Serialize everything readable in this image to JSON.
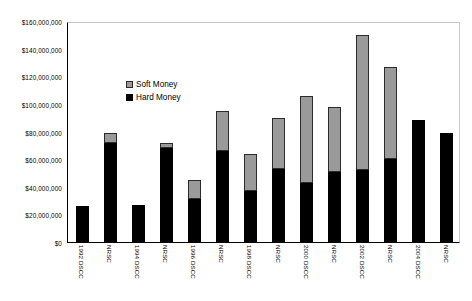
{
  "chart_data": {
    "type": "bar",
    "subtype": "stacked",
    "title": "",
    "xlabel": "",
    "ylabel": "",
    "ylim": [
      0,
      160000000
    ],
    "ytick_values": [
      0,
      20000000,
      40000000,
      60000000,
      80000000,
      100000000,
      120000000,
      140000000,
      160000000
    ],
    "ytick_labels": [
      "$0",
      "$20,000,000",
      "$40,000,000",
      "$60,000,000",
      "$80,000,000",
      "$100,000,000",
      "$120,000,000",
      "$140,000,000",
      "$160,000,000"
    ],
    "grid": false,
    "legend_position": "inside-upper-left",
    "categories": [
      "1992 DSCC",
      "NRSC",
      "1994 DSCC",
      "NRSC",
      "1996 DSCC",
      "NRSC",
      "1998 DSCC",
      "NRSC",
      "2000 DSCC",
      "NRSC",
      "2002 DSCC",
      "NRSC",
      "2004 DSCC",
      "NRSC"
    ],
    "series": [
      {
        "name": "Hard Money",
        "color": "#000000",
        "values": [
          26000000,
          72000000,
          27000000,
          68000000,
          31000000,
          66000000,
          37000000,
          53000000,
          43000000,
          51000000,
          52000000,
          60000000,
          88000000,
          79000000
        ]
      },
      {
        "name": "Soft Money",
        "color": "#9a9a9a",
        "values": [
          0,
          7000000,
          0,
          4000000,
          14000000,
          29000000,
          27000000,
          37000000,
          63000000,
          47000000,
          98000000,
          67000000,
          0,
          0
        ]
      }
    ],
    "totals": [
      26000000,
      79000000,
      27000000,
      72000000,
      45000000,
      95000000,
      64000000,
      90000000,
      106000000,
      98000000,
      150000000,
      127000000,
      88000000,
      79000000
    ]
  },
  "legend": {
    "items": [
      {
        "label": "Soft Money",
        "swatch": "soft-money-swatch"
      },
      {
        "label": "Hard Money",
        "swatch": "hard-money-swatch"
      }
    ]
  }
}
